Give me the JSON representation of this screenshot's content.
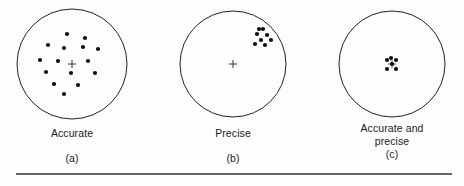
{
  "figure": {
    "background_color": "#fdfdfd",
    "ink_color": "#111111",
    "circle_stroke_color": "#222222",
    "rule_color": "#333333"
  },
  "panels": [
    {
      "id": "a",
      "caption": "Accurate",
      "index_label": "(a)",
      "circle": {
        "cx": 72,
        "cy": 64,
        "r": 55
      },
      "center_mark": {
        "type": "cross",
        "x": 72,
        "y": 64,
        "size": 8,
        "visible": true
      },
      "dot_radius": 2.1,
      "dots": [
        {
          "x": 67,
          "y": 34
        },
        {
          "x": 85,
          "y": 38
        },
        {
          "x": 48,
          "y": 45
        },
        {
          "x": 64,
          "y": 48
        },
        {
          "x": 83,
          "y": 47
        },
        {
          "x": 98,
          "y": 49
        },
        {
          "x": 40,
          "y": 60
        },
        {
          "x": 58,
          "y": 61
        },
        {
          "x": 88,
          "y": 61
        },
        {
          "x": 46,
          "y": 72
        },
        {
          "x": 71,
          "y": 73
        },
        {
          "x": 95,
          "y": 73
        },
        {
          "x": 54,
          "y": 84
        },
        {
          "x": 78,
          "y": 85
        },
        {
          "x": 64,
          "y": 94
        }
      ]
    },
    {
      "id": "b",
      "caption": "Precise",
      "index_label": "(b)",
      "circle": {
        "cx": 233,
        "cy": 64,
        "r": 53
      },
      "center_mark": {
        "type": "cross",
        "x": 233,
        "y": 64,
        "size": 8,
        "visible": true
      },
      "dot_radius": 2.1,
      "dots": [
        {
          "x": 263,
          "y": 29
        },
        {
          "x": 257,
          "y": 34
        },
        {
          "x": 267,
          "y": 35
        },
        {
          "x": 261,
          "y": 40
        },
        {
          "x": 271,
          "y": 40
        },
        {
          "x": 255,
          "y": 44
        },
        {
          "x": 265,
          "y": 45
        },
        {
          "x": 259,
          "y": 29
        }
      ]
    },
    {
      "id": "c",
      "caption": "Accurate and\nprecise",
      "index_label": "(c)",
      "circle": {
        "cx": 392,
        "cy": 64,
        "r": 53
      },
      "center_mark": {
        "type": "cross",
        "x": 392,
        "y": 64,
        "size": 8,
        "visible": true
      },
      "dot_radius": 2.1,
      "dots": [
        {
          "x": 387,
          "y": 60
        },
        {
          "x": 396,
          "y": 60
        },
        {
          "x": 392,
          "y": 64
        },
        {
          "x": 387,
          "y": 69
        },
        {
          "x": 396,
          "y": 69
        },
        {
          "x": 391,
          "y": 58
        }
      ]
    }
  ],
  "bottom_rule": {
    "x1": 16,
    "y1": 174,
    "x2": 452,
    "y2": 174,
    "thickness": 1.6
  }
}
